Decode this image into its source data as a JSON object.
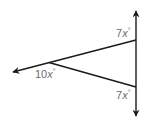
{
  "diagram": {
    "type": "geometry-angles",
    "colors": {
      "line": "#1a1a1a",
      "label": "#6b6b6b",
      "background": "#ffffff"
    },
    "vertical_line": {
      "description": "vertical line with arrows at both ends",
      "x": 136,
      "y_top": 10,
      "y_bottom": 117
    },
    "ray": {
      "description": "ray from upper intersection extending left through vertex",
      "from": [
        136,
        40
      ],
      "to": [
        12,
        72
      ]
    },
    "segment": {
      "description": "segment from vertex to lower intersection",
      "from": [
        49,
        63
      ],
      "to": [
        136,
        87
      ]
    },
    "labels": {
      "top_angle": {
        "coef": "7",
        "var": "x",
        "deg": "°"
      },
      "vertex_angle": {
        "coef": "10",
        "var": "x",
        "deg": "°"
      },
      "bottom_angle": {
        "coef": "7",
        "var": "x",
        "deg": "°"
      }
    }
  }
}
